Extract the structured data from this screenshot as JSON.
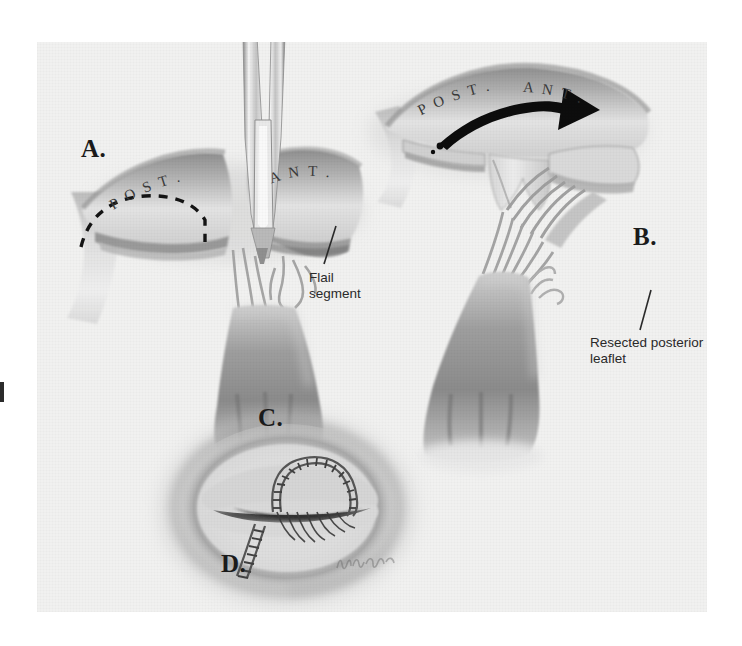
{
  "figure": {
    "background_color": "#ffffff",
    "plate_color": "#f1f1f0",
    "ink_color": "#2a2a2a"
  },
  "panels": [
    {
      "id": "A",
      "label": "A.",
      "description": "Posterior leaflet flail segment with scissors marking quadrangular resection; dashed resection line on posterior leaflet"
    },
    {
      "id": "B",
      "label": "B.",
      "description": "Resected posterior leaflet segment being removed; curved arrow indicates direction of removal"
    },
    {
      "id": "C",
      "label": "C.",
      "description": "Surgeon's view of annulus with annuloplasty sutures placed"
    },
    {
      "id": "D",
      "label": "D.",
      "description": "Completed repair with sutured leaflet closure"
    }
  ],
  "annotations": [
    {
      "name": "flail-segment",
      "text": "Flail\nsegment"
    },
    {
      "name": "resected-posterior-leaflet",
      "text": "Resected posterior\nleaflet"
    }
  ],
  "leaflet_labels": {
    "panel_a_posterior": "P O S T .",
    "panel_a_anterior": "A N T .",
    "panel_b_posterior": "P O S T .",
    "panel_b_anterior": "A N T ."
  },
  "signature": {
    "name": "artist-signature",
    "text": "Kane"
  }
}
